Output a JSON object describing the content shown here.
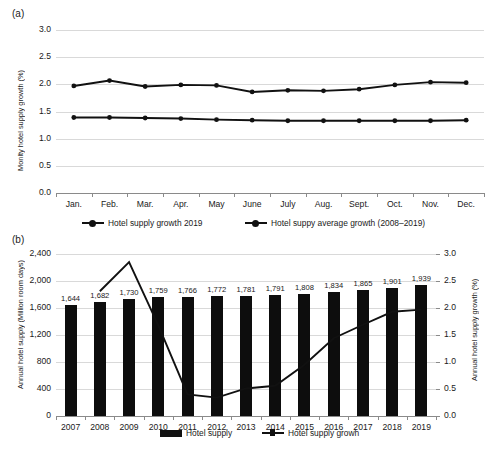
{
  "figure": {
    "panel_a_letter": "(a)",
    "panel_b_letter": "(b)"
  },
  "chart_data": [
    {
      "id": "panel-a",
      "type": "line",
      "title": "",
      "xlabel": "",
      "ylabel": "Monlty hotel supply growth (%)",
      "ylim": [
        0.0,
        3.0
      ],
      "yticks": [
        "0.0",
        "0.5",
        "1.0",
        "1.5",
        "2.0",
        "2.5",
        "3.0"
      ],
      "ytick_values": [
        0.0,
        0.5,
        1.0,
        1.5,
        2.0,
        2.5,
        3.0
      ],
      "grid": true,
      "legend_position": "bottom",
      "categories": [
        "Jan.",
        "Feb.",
        "Mar.",
        "Apr.",
        "May",
        "June",
        "July",
        "Aug.",
        "Sept.",
        "Oct.",
        "Nov.",
        "Dec."
      ],
      "series": [
        {
          "name": "Hotel supply growth 2019",
          "values": [
            1.97,
            2.07,
            1.96,
            1.99,
            1.98,
            1.86,
            1.89,
            1.88,
            1.91,
            1.99,
            2.04,
            2.03
          ]
        },
        {
          "name": "Hotel suppy average growth (2008–2019)",
          "values": [
            1.39,
            1.39,
            1.38,
            1.37,
            1.35,
            1.34,
            1.33,
            1.33,
            1.33,
            1.33,
            1.33,
            1.34
          ]
        }
      ]
    },
    {
      "id": "panel-b",
      "type": "bar",
      "title": "",
      "xlabel": "",
      "ylabel": "Annual hotel supply (Million room days)",
      "ylabel_right": "Annual hotel supply growth (%)",
      "ylim": [
        0,
        2400
      ],
      "ylim_right": [
        0.0,
        3.0
      ],
      "yticks": [
        "0",
        "400",
        "800",
        "1,200",
        "1,600",
        "2,000",
        "2,400"
      ],
      "ytick_values": [
        0,
        400,
        800,
        1200,
        1600,
        2000,
        2400
      ],
      "yticks_right": [
        "0.0",
        "0.5",
        "1.0",
        "1.5",
        "2.0",
        "2.5",
        "3.0"
      ],
      "ytick_values_right": [
        0.0,
        0.5,
        1.0,
        1.5,
        2.0,
        2.5,
        3.0
      ],
      "grid": true,
      "legend_position": "bottom",
      "categories": [
        "2007",
        "2008",
        "2009",
        "2010",
        "2011",
        "2012",
        "2013",
        "2014",
        "2015",
        "2016",
        "2017",
        "2018",
        "2019"
      ],
      "series": [
        {
          "name": "Hotel supply",
          "type": "bar",
          "axis": "left",
          "values": [
            1644,
            1682,
            1730,
            1759,
            1766,
            1772,
            1781,
            1791,
            1808,
            1834,
            1865,
            1901,
            1939
          ],
          "labels": [
            "1,644",
            "1,682",
            "1,730",
            "1,759",
            "1,766",
            "1,772",
            "1,781",
            "1,791",
            "1,808",
            "1,834",
            "1,865",
            "1,901",
            "1,939"
          ]
        },
        {
          "name": "Hotel supply growh",
          "type": "line",
          "axis": "right",
          "values": [
            null,
            2.31,
            2.85,
            1.68,
            0.4,
            0.34,
            0.51,
            0.56,
            0.95,
            1.44,
            1.69,
            1.93,
            1.97
          ]
        }
      ]
    }
  ]
}
